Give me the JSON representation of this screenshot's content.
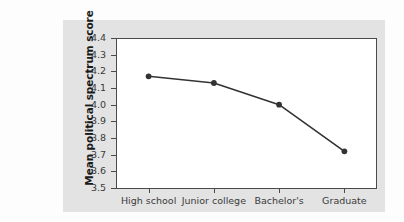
{
  "chart_data": {
    "type": "line",
    "title": "",
    "xlabel": "",
    "ylabel": "Mean political spectrum score",
    "categories": [
      "High school",
      "Junior college",
      "Bachelor's",
      "Graduate"
    ],
    "values": [
      4.17,
      4.13,
      4.0,
      3.72
    ],
    "series": [
      {
        "name": "Mean political spectrum score",
        "values": [
          4.17,
          4.13,
          4.0,
          3.72
        ]
      }
    ],
    "ylim": [
      3.5,
      4.4
    ],
    "y_ticks": [
      "4.4",
      "4.3",
      "4.2",
      "4.1",
      "4.0",
      "3.9",
      "3.8",
      "3.7",
      "3.6",
      "3.5"
    ],
    "y_tick_values": [
      4.4,
      4.3,
      4.2,
      4.1,
      4.0,
      3.9,
      3.8,
      3.7,
      3.6,
      3.5
    ],
    "grid": false,
    "legend": false,
    "legend_position": "none",
    "marker": "circle",
    "line_color": "#333333",
    "marker_color": "#333333",
    "panel_color": "#e3e3e3",
    "plot_background": "#ffffff",
    "axis_color": "#4a4a4a"
  },
  "axis": {
    "y_title": "Mean political spectrum score"
  }
}
